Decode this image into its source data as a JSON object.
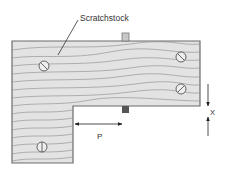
{
  "diagram": {
    "title_label": "Scratchstock",
    "dimension_p": "P",
    "dimension_x": "X",
    "colors": {
      "wood_fill": "#e3e3e3",
      "grain": "#8a8a8a",
      "outline": "#6b6b6b",
      "blade": "#8c8c8c",
      "blade_bottom": "#555555",
      "arrow": "#222222"
    },
    "components": [
      "L-shaped wooden stock",
      "blade",
      "4 screws",
      "dimension P",
      "dimension X"
    ]
  }
}
